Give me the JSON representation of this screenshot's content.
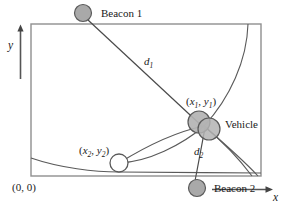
{
  "figure": {
    "title": "",
    "colors": {
      "stroke": "#4a4a4a",
      "beacon_fill": "#a8a8a8",
      "vehicle_fill": "#b0b0b0",
      "unknown_fill": "#ffffff",
      "text": "#1a1a1a",
      "boundary": "#8a8a8a"
    }
  },
  "axes": {
    "y_label": "y",
    "x_label": "x",
    "origin_label": "(0, 0)"
  },
  "nodes": {
    "beacon1": {
      "label": "Beacon 1",
      "cx": 83,
      "cy": 13,
      "r": 8.5
    },
    "beacon2": {
      "label": "Beacon 2",
      "cx": 197,
      "cy": 188,
      "r": 8.5
    },
    "vehicle": {
      "label": "Vehicle",
      "coord_label_x": "x",
      "coord_label_x_sub": "1",
      "coord_label_y": "y",
      "coord_label_y_sub": "1",
      "cx": 204,
      "cy": 126,
      "r": 11
    },
    "unknown_point": {
      "coord_label_x": "x",
      "coord_label_x_sub": "2",
      "coord_label_y": "y",
      "coord_label_y_sub": "2",
      "cx": 119,
      "cy": 163,
      "r": 9
    }
  },
  "distances": {
    "d1": {
      "label": "d",
      "sub": "1"
    },
    "d2": {
      "label": "d",
      "sub": "2"
    }
  }
}
